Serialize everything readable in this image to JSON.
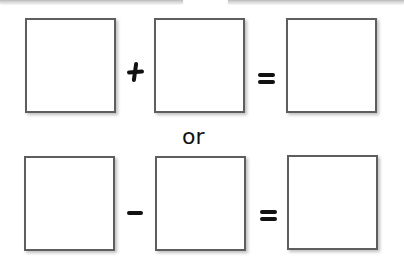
{
  "worksheet": {
    "row1": {
      "operator": "+",
      "equals": "=",
      "boxes": [
        "",
        "",
        ""
      ]
    },
    "separator_text": "or",
    "row2": {
      "operator": "-",
      "equals": "=",
      "boxes": [
        "",
        "",
        ""
      ]
    }
  },
  "colors": {
    "box_border": "#5e5e5e",
    "symbol": "#111111",
    "background": "#ffffff"
  }
}
